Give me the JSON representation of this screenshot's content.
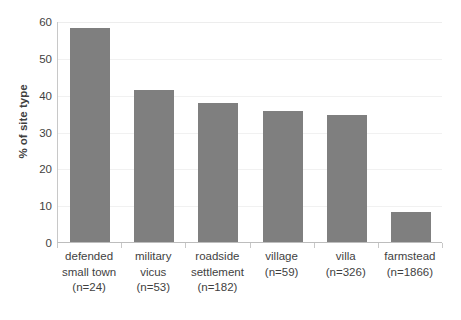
{
  "chart_data": {
    "type": "bar",
    "title": "",
    "xlabel": "",
    "ylabel": "% of site type",
    "ylim": [
      0,
      60
    ],
    "yticks": [
      0,
      10,
      20,
      30,
      40,
      50,
      60
    ],
    "grid": true,
    "legend": "none",
    "bar_color": "#7f7f7f",
    "categories": [
      "defended small town (n=24)",
      "military vicus (n=53)",
      "roadside settlement (n=182)",
      "village (n=59)",
      "villa (n=326)",
      "farmstead (n=1866)"
    ],
    "category_lines": [
      [
        "defended",
        "small town",
        "(n=24)"
      ],
      [
        "military",
        "vicus",
        "(n=53)"
      ],
      [
        "roadside",
        "settlement",
        "(n=182)"
      ],
      [
        "village",
        "(n=59)"
      ],
      [
        "villa",
        "(n=326)"
      ],
      [
        "farmstead",
        "(n=1866)"
      ]
    ],
    "counts": [
      24,
      53,
      182,
      59,
      326,
      1866
    ],
    "values": [
      58.1,
      41.4,
      37.8,
      35.5,
      34.6,
      8.1
    ]
  }
}
